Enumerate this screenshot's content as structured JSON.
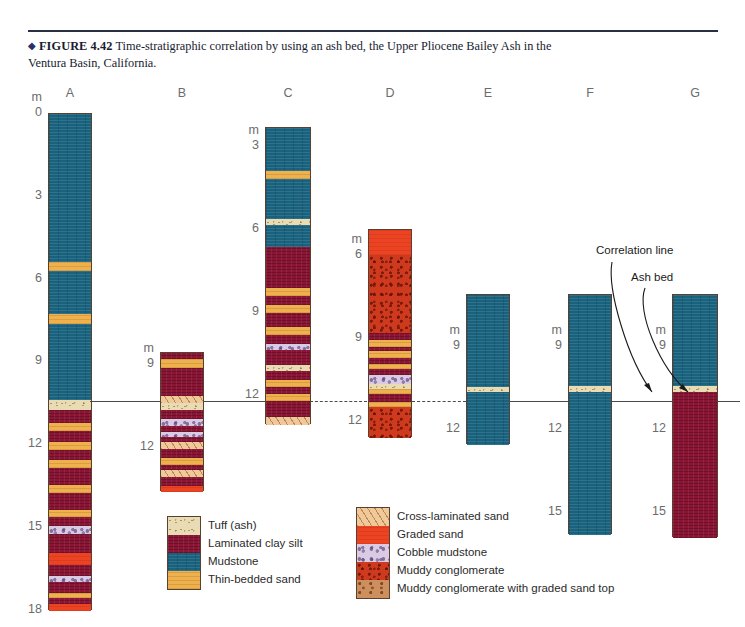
{
  "caption": {
    "diamond": "◆",
    "figure_label": "FIGURE 4.42",
    "text": "Time-stratigraphic correlation by using an ash bed, the Upper Pliocene Bailey Ash in the Ventura Basin, California."
  },
  "annotations": {
    "correlation_line": "Correlation line",
    "ash_bed": "Ash bed"
  },
  "unit_symbol": "m",
  "columns": [
    {
      "id": "A",
      "label": "A",
      "left": 48,
      "width": 44,
      "top": 113,
      "top_depth": 0,
      "bottom_depth": 18.0,
      "scale_marks": [
        {
          "value": "0",
          "depth": 0,
          "show_unit": true
        },
        {
          "value": "3",
          "depth": 3
        },
        {
          "value": "6",
          "depth": 6
        },
        {
          "value": "9",
          "depth": 9
        },
        {
          "value": "12",
          "depth": 12
        },
        {
          "value": "15",
          "depth": 15
        },
        {
          "value": "18",
          "depth": 18
        }
      ],
      "beds": [
        {
          "lith": "mudstone",
          "from": 0.0,
          "to": 5.35
        },
        {
          "lith": "thinsand",
          "from": 5.35,
          "to": 5.7
        },
        {
          "lith": "mudstone",
          "from": 5.7,
          "to": 7.25
        },
        {
          "lith": "thinsand",
          "from": 7.25,
          "to": 7.62
        },
        {
          "lith": "mudstone",
          "from": 7.62,
          "to": 10.35
        },
        {
          "lith": "tuff",
          "from": 10.35,
          "to": 10.72
        },
        {
          "lith": "claysilt",
          "from": 10.72,
          "to": 11.2
        },
        {
          "lith": "thinsand",
          "from": 11.2,
          "to": 11.48
        },
        {
          "lith": "claysilt",
          "from": 11.48,
          "to": 11.9
        },
        {
          "lith": "thinsand",
          "from": 11.9,
          "to": 12.18
        },
        {
          "lith": "claysilt",
          "from": 12.18,
          "to": 12.55
        },
        {
          "lith": "thinsand",
          "from": 12.55,
          "to": 12.82
        },
        {
          "lith": "claysilt",
          "from": 12.82,
          "to": 13.45
        },
        {
          "lith": "thinsand",
          "from": 13.45,
          "to": 13.75
        },
        {
          "lith": "claysilt",
          "from": 13.75,
          "to": 14.35
        },
        {
          "lith": "thinsand",
          "from": 14.35,
          "to": 14.62
        },
        {
          "lith": "claysilt",
          "from": 14.62,
          "to": 14.92
        },
        {
          "lith": "cobblemud",
          "from": 14.92,
          "to": 15.22
        },
        {
          "lith": "claysilt",
          "from": 15.22,
          "to": 15.92
        },
        {
          "lith": "gradedsand",
          "from": 15.92,
          "to": 16.35
        },
        {
          "lith": "claysilt",
          "from": 16.35,
          "to": 16.75
        },
        {
          "lith": "cobblemud",
          "from": 16.75,
          "to": 16.98
        },
        {
          "lith": "claysilt",
          "from": 16.98,
          "to": 17.35
        },
        {
          "lith": "thinsand",
          "from": 17.35,
          "to": 17.55
        },
        {
          "lith": "claysilt",
          "from": 17.55,
          "to": 17.75
        },
        {
          "lith": "gradedsand",
          "from": 17.75,
          "to": 18.0
        }
      ]
    },
    {
      "id": "B",
      "label": "B",
      "left": 160,
      "width": 44,
      "top": 352,
      "top_depth": 8.55,
      "bottom_depth": 13.6,
      "scale_marks": [
        {
          "value": "9",
          "depth": 9,
          "show_unit": true
        },
        {
          "value": "12",
          "depth": 12
        }
      ],
      "beds": [
        {
          "lith": "claysilt",
          "from": 8.55,
          "to": 8.78
        },
        {
          "lith": "thinsand",
          "from": 8.78,
          "to": 9.08
        },
        {
          "lith": "claysilt",
          "from": 9.08,
          "to": 10.12
        },
        {
          "lith": "xlam",
          "from": 10.12,
          "to": 10.38
        },
        {
          "lith": "tuff",
          "from": 10.38,
          "to": 10.62
        },
        {
          "lith": "claysilt",
          "from": 10.62,
          "to": 10.95
        },
        {
          "lith": "cobblemud",
          "from": 10.95,
          "to": 11.18
        },
        {
          "lith": "claysilt",
          "from": 11.18,
          "to": 11.4
        },
        {
          "lith": "cobblemud",
          "from": 11.4,
          "to": 11.6
        },
        {
          "lith": "claysilt",
          "from": 11.6,
          "to": 11.78
        },
        {
          "lith": "xlam",
          "from": 11.78,
          "to": 12.02
        },
        {
          "lith": "claysilt",
          "from": 12.02,
          "to": 12.35
        },
        {
          "lith": "thinsand",
          "from": 12.35,
          "to": 12.6
        },
        {
          "lith": "claysilt",
          "from": 12.6,
          "to": 12.8
        },
        {
          "lith": "xlam",
          "from": 12.8,
          "to": 13.05
        },
        {
          "lith": "claysilt",
          "from": 13.05,
          "to": 13.38
        },
        {
          "lith": "gradedsand",
          "from": 13.38,
          "to": 13.6
        }
      ]
    },
    {
      "id": "C",
      "label": "C",
      "left": 265,
      "width": 46,
      "top": 127,
      "top_depth": 2.3,
      "bottom_depth": 13.05,
      "scale_marks": [
        {
          "value": "3",
          "depth": 3,
          "show_unit": true
        },
        {
          "value": "6",
          "depth": 6
        },
        {
          "value": "9",
          "depth": 9
        },
        {
          "value": "12",
          "depth": 12
        }
      ],
      "beds": [
        {
          "lith": "mudstone",
          "from": 2.3,
          "to": 3.85
        },
        {
          "lith": "thinsand",
          "from": 3.85,
          "to": 4.15
        },
        {
          "lith": "mudstone",
          "from": 4.15,
          "to": 5.6
        },
        {
          "lith": "tuff",
          "from": 5.6,
          "to": 5.82
        },
        {
          "lith": "mudstone",
          "from": 5.82,
          "to": 6.62
        },
        {
          "lith": "claysilt",
          "from": 6.62,
          "to": 8.1
        },
        {
          "lith": "thinsand",
          "from": 8.1,
          "to": 8.4
        },
        {
          "lith": "claysilt",
          "from": 8.4,
          "to": 8.72
        },
        {
          "lith": "thinsand",
          "from": 8.72,
          "to": 9.0
        },
        {
          "lith": "claysilt",
          "from": 9.0,
          "to": 9.52
        },
        {
          "lith": "thinsand",
          "from": 9.52,
          "to": 9.82
        },
        {
          "lith": "claysilt",
          "from": 9.82,
          "to": 10.12
        },
        {
          "lith": "cobblemud",
          "from": 10.12,
          "to": 10.35
        },
        {
          "lith": "claysilt",
          "from": 10.35,
          "to": 10.88
        },
        {
          "lith": "tuff",
          "from": 10.88,
          "to": 11.12
        },
        {
          "lith": "claysilt",
          "from": 11.12,
          "to": 11.42
        },
        {
          "lith": "thinsand",
          "from": 11.42,
          "to": 11.68
        },
        {
          "lith": "claysilt",
          "from": 11.68,
          "to": 11.95
        },
        {
          "lith": "thinsand",
          "from": 11.95,
          "to": 12.18
        },
        {
          "lith": "claysilt",
          "from": 12.18,
          "to": 12.78
        },
        {
          "lith": "xlam",
          "from": 12.78,
          "to": 13.05
        }
      ]
    },
    {
      "id": "D",
      "label": "D",
      "left": 368,
      "width": 44,
      "top": 229,
      "top_depth": 5.05,
      "bottom_depth": 12.6,
      "scale_marks": [
        {
          "value": "6",
          "depth": 6,
          "show_unit": true
        },
        {
          "value": "9",
          "depth": 9
        },
        {
          "value": "12",
          "depth": 12
        }
      ],
      "beds": [
        {
          "lith": "gradedsand",
          "from": 5.05,
          "to": 5.95
        },
        {
          "lith": "muddyconglom",
          "from": 5.95,
          "to": 8.8
        },
        {
          "lith": "claysilt",
          "from": 8.8,
          "to": 9.05
        },
        {
          "lith": "thinsand",
          "from": 9.05,
          "to": 9.3
        },
        {
          "lith": "claysilt",
          "from": 9.3,
          "to": 9.45
        },
        {
          "lith": "thinsand",
          "from": 9.45,
          "to": 9.68
        },
        {
          "lith": "claysilt",
          "from": 9.68,
          "to": 9.92
        },
        {
          "lith": "thinsand",
          "from": 9.92,
          "to": 10.08
        },
        {
          "lith": "claysilt",
          "from": 10.08,
          "to": 10.32
        },
        {
          "lith": "cobblemud",
          "from": 10.32,
          "to": 10.62
        },
        {
          "lith": "tuff",
          "from": 10.62,
          "to": 10.8
        },
        {
          "lith": "thinsand",
          "from": 10.8,
          "to": 11.0
        },
        {
          "lith": "claysilt",
          "from": 11.0,
          "to": 11.28
        },
        {
          "lith": "thinsand",
          "from": 11.28,
          "to": 11.45
        },
        {
          "lith": "muddyconglom",
          "from": 11.45,
          "to": 12.6
        }
      ]
    },
    {
      "id": "E",
      "label": "E",
      "left": 466,
      "width": 44,
      "top": 294,
      "top_depth": 7.1,
      "bottom_depth": 12.55,
      "scale_marks": [
        {
          "value": "9",
          "depth": 9,
          "show_unit": true
        },
        {
          "value": "12",
          "depth": 12
        }
      ],
      "beds": [
        {
          "lith": "mudstone",
          "from": 7.1,
          "to": 10.42
        },
        {
          "lith": "tuff",
          "from": 10.42,
          "to": 10.62
        },
        {
          "lith": "mudstone",
          "from": 10.62,
          "to": 12.55
        }
      ]
    },
    {
      "id": "F",
      "label": "F",
      "left": 568,
      "width": 44,
      "top": 294,
      "top_depth": 7.1,
      "bottom_depth": 15.8,
      "scale_marks": [
        {
          "value": "9",
          "depth": 9,
          "show_unit": true
        },
        {
          "value": "12",
          "depth": 12
        },
        {
          "value": "15",
          "depth": 15
        }
      ],
      "beds": [
        {
          "lith": "mudstone",
          "from": 7.1,
          "to": 10.4
        },
        {
          "lith": "tuff",
          "from": 10.4,
          "to": 10.62
        },
        {
          "lith": "mudstone",
          "from": 10.62,
          "to": 15.8
        }
      ]
    },
    {
      "id": "G",
      "label": "G",
      "left": 672,
      "width": 46,
      "top": 294,
      "top_depth": 7.1,
      "bottom_depth": 15.9,
      "scale_marks": [
        {
          "value": "9",
          "depth": 9,
          "show_unit": true
        },
        {
          "value": "12",
          "depth": 12
        },
        {
          "value": "15",
          "depth": 15
        }
      ],
      "beds": [
        {
          "lith": "mudstone",
          "from": 7.1,
          "to": 10.4
        },
        {
          "lith": "tuff",
          "from": 10.4,
          "to": 10.62
        },
        {
          "lith": "claysilt",
          "from": 10.62,
          "to": 15.9
        }
      ]
    }
  ],
  "legend": {
    "left_group": [
      {
        "lith": "tuff",
        "label": "Tuff (ash)"
      },
      {
        "lith": "claysilt",
        "label": "Laminated clay silt"
      },
      {
        "lith": "mudstone",
        "label": "Mudstone"
      },
      {
        "lith": "thinsand",
        "label": "Thin-bedded sand"
      }
    ],
    "right_group": [
      {
        "lith": "xlam",
        "label": "Cross-laminated sand"
      },
      {
        "lith": "gradedsand",
        "label": "Graded sand"
      },
      {
        "lith": "cobblemud",
        "label": "Cobble mudstone"
      },
      {
        "lith": "muddyconglom",
        "label": "Muddy conglomerate"
      },
      {
        "lith": "conglomgraded",
        "label": "Muddy conglomerate with graded sand top"
      }
    ]
  },
  "colors": {
    "mudstone": "#18627e",
    "claysilt": "#8c1435",
    "thinsand": "#eeb14e",
    "tuff": "#e9dcb4",
    "xlam": "#f0c99a",
    "gradedsand": "#ec4423",
    "cobblemud": "#d9cbe4",
    "muddyconglom": "#cf3a1e",
    "conglomgraded": "#cd8f5e",
    "correlation_line": "#4a4a4a",
    "caption_text": "#181c30"
  },
  "scale_geometry": {
    "px_per_m": 27.6,
    "zero_y_px": 113
  }
}
